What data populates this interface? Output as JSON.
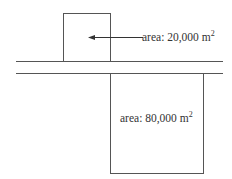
{
  "small_area": {
    "prefix": "area: 20,000 m",
    "exp": "2"
  },
  "large_area": {
    "prefix": "area: 80,000 m",
    "exp": "2"
  }
}
